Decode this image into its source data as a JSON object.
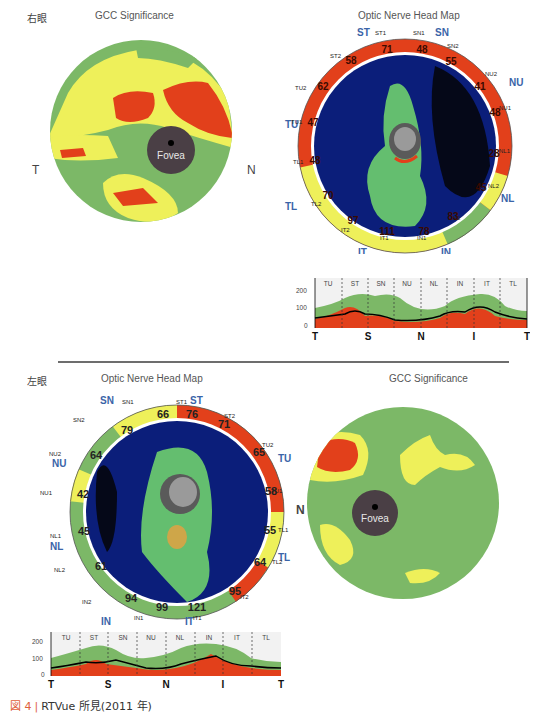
{
  "right_eye": {
    "label": "右眼",
    "gcc": {
      "title": "GCC Significance",
      "left_letter": "T",
      "right_letter": "N",
      "fovea_label": "Fovea"
    },
    "onh": {
      "title": "Optic Nerve Head Map",
      "quadrants": [
        "ST",
        "SN",
        "NU",
        "NL",
        "IN",
        "IT",
        "TL",
        "TU"
      ],
      "sectors": [
        {
          "name": "ST1",
          "value": "71",
          "color": "red"
        },
        {
          "name": "SN1",
          "value": "48",
          "color": "red"
        },
        {
          "name": "SN2",
          "value": "55",
          "color": "red"
        },
        {
          "name": "NU2",
          "value": "41",
          "color": "red"
        },
        {
          "name": "NU1",
          "value": "48",
          "color": "red"
        },
        {
          "name": "NL1",
          "value": "28",
          "color": "red"
        },
        {
          "name": "NL2",
          "value": "45",
          "color": "yellow"
        },
        {
          "name": "IN2",
          "value": "83",
          "color": "green"
        },
        {
          "name": "IN1",
          "value": "78",
          "color": "yellow"
        },
        {
          "name": "IT1",
          "value": "111",
          "color": "yellow"
        },
        {
          "name": "IT2",
          "value": "97",
          "color": "yellow"
        },
        {
          "name": "TL2",
          "value": "70",
          "color": "yellow"
        },
        {
          "name": "TL1",
          "value": "48",
          "color": "red"
        },
        {
          "name": "TU1",
          "value": "47",
          "color": "red"
        },
        {
          "name": "TU2",
          "value": "62",
          "color": "red"
        },
        {
          "name": "ST2",
          "value": "58",
          "color": "red"
        }
      ]
    },
    "tsnit": {
      "y_ticks": [
        "200",
        "100",
        "0"
      ],
      "sector_labels": [
        "TU",
        "ST",
        "SN",
        "NU",
        "NL",
        "IN",
        "IT",
        "TL"
      ],
      "x_labels": [
        "T",
        "S",
        "N",
        "I",
        "T"
      ]
    }
  },
  "left_eye": {
    "label": "左眼",
    "gcc": {
      "title": "GCC Significance",
      "left_letter": "N",
      "fovea_label": "Fovea"
    },
    "onh": {
      "title": "Optic Nerve Head Map",
      "quadrants": [
        "SN",
        "ST",
        "TU",
        "TL",
        "IT",
        "IN",
        "NL",
        "NU"
      ],
      "sectors": [
        {
          "name": "SN1",
          "value": "66",
          "color": "yellow"
        },
        {
          "name": "ST1",
          "value": "76",
          "color": "red"
        },
        {
          "name": "ST2",
          "value": "71",
          "color": "red"
        },
        {
          "name": "TU2",
          "value": "65",
          "color": "red"
        },
        {
          "name": "TU1",
          "value": "58",
          "color": "red"
        },
        {
          "name": "TL1",
          "value": "55",
          "color": "yellow"
        },
        {
          "name": "TL2",
          "value": "64",
          "color": "yellow"
        },
        {
          "name": "IT2",
          "value": "95",
          "color": "red"
        },
        {
          "name": "IT1",
          "value": "121",
          "color": "green"
        },
        {
          "name": "IN1",
          "value": "99",
          "color": "green"
        },
        {
          "name": "IN2",
          "value": "94",
          "color": "green"
        },
        {
          "name": "NL2",
          "value": "61",
          "color": "green"
        },
        {
          "name": "NL1",
          "value": "45",
          "color": "green"
        },
        {
          "name": "NU1",
          "value": "42",
          "color": "yellow"
        },
        {
          "name": "NU2",
          "value": "64",
          "color": "green"
        },
        {
          "name": "SN2",
          "value": "79",
          "color": "yellow"
        }
      ]
    },
    "tsnit": {
      "y_ticks": [
        "200",
        "100",
        "0"
      ],
      "sector_labels": [
        "TU",
        "ST",
        "SN",
        "NU",
        "NL",
        "IN",
        "IT",
        "TL"
      ],
      "x_labels": [
        "T",
        "S",
        "N",
        "I",
        "T"
      ]
    }
  },
  "caption": {
    "figure": "図 4",
    "separator": "|",
    "text": "RTVue 所見(2011 年)"
  },
  "colors": {
    "red": "#e2401b",
    "yellow": "#eef05a",
    "green": "#7cb867",
    "quadrant_blue": "#3a64a8",
    "fovea": "#4a3f45"
  }
}
